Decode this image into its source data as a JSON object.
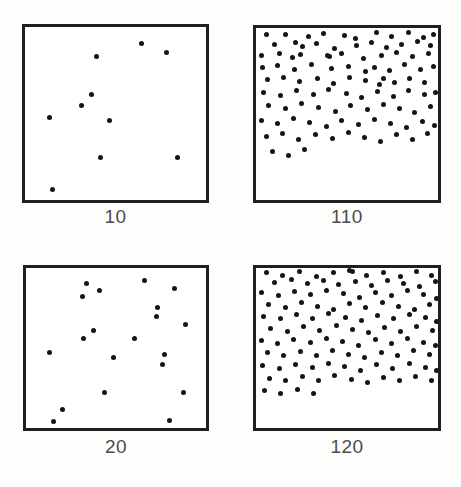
{
  "figure": {
    "width": 461,
    "height": 487,
    "background_color": "#fdfdfc",
    "frame_color": "#1f1f1f",
    "frame_width_px": 3,
    "dot_color": "#151515",
    "dot_diameter_px": 5,
    "label_color": "#4c4c4c",
    "label_font_size_px": 19
  },
  "chart_data": {
    "type": "scatter",
    "title": "",
    "subtitle": "",
    "xlabel": "",
    "ylabel": "",
    "grid": false,
    "legend": null,
    "axis_ticks": false,
    "xlim": [
      0,
      1
    ],
    "ylim": [
      0,
      1
    ],
    "panels": [
      {
        "id": "panel-10",
        "label": "10",
        "count": 10,
        "row": 0,
        "col": 0,
        "frame": {
          "x": 22,
          "y": 24,
          "width": 187,
          "height": 179
        },
        "label_y": 206,
        "points": [
          [
            0.395,
            0.168
          ],
          [
            0.642,
            0.095
          ],
          [
            0.781,
            0.145
          ],
          [
            0.369,
            0.391
          ],
          [
            0.31,
            0.452
          ],
          [
            0.134,
            0.525
          ],
          [
            0.465,
            0.542
          ],
          [
            0.417,
            0.754
          ],
          [
            0.845,
            0.754
          ],
          [
            0.15,
            0.939
          ]
        ]
      },
      {
        "id": "panel-110",
        "label": "110",
        "count": 110,
        "row": 0,
        "col": 1,
        "frame": {
          "x": 253,
          "y": 25,
          "width": 188,
          "height": 178
        },
        "label_y": 206,
        "points": [
          [
            0.055,
            0.04
          ],
          [
            0.163,
            0.036
          ],
          [
            0.286,
            0.052
          ],
          [
            0.373,
            0.03
          ],
          [
            0.487,
            0.044
          ],
          [
            0.546,
            0.062
          ],
          [
            0.661,
            0.028
          ],
          [
            0.742,
            0.05
          ],
          [
            0.838,
            0.024
          ],
          [
            0.921,
            0.056
          ],
          [
            0.978,
            0.038
          ],
          [
            0.1,
            0.095
          ],
          [
            0.215,
            0.082
          ],
          [
            0.258,
            0.108
          ],
          [
            0.33,
            0.09
          ],
          [
            0.43,
            0.118
          ],
          [
            0.552,
            0.1
          ],
          [
            0.632,
            0.082
          ],
          [
            0.716,
            0.112
          ],
          [
            0.802,
            0.094
          ],
          [
            0.885,
            0.076
          ],
          [
            0.958,
            0.104
          ],
          [
            0.028,
            0.16
          ],
          [
            0.128,
            0.148
          ],
          [
            0.198,
            0.172
          ],
          [
            0.243,
            0.152
          ],
          [
            0.392,
            0.162
          ],
          [
            0.403,
            0.168
          ],
          [
            0.47,
            0.146
          ],
          [
            0.588,
            0.176
          ],
          [
            0.688,
            0.158
          ],
          [
            0.77,
            0.14
          ],
          [
            0.861,
            0.168
          ],
          [
            0.946,
            0.15
          ],
          [
            0.038,
            0.232
          ],
          [
            0.12,
            0.218
          ],
          [
            0.211,
            0.244
          ],
          [
            0.307,
            0.21
          ],
          [
            0.414,
            0.238
          ],
          [
            0.508,
            0.222
          ],
          [
            0.6,
            0.252
          ],
          [
            0.652,
            0.228
          ],
          [
            0.732,
            0.246
          ],
          [
            0.818,
            0.214
          ],
          [
            0.902,
            0.24
          ],
          [
            0.974,
            0.224
          ],
          [
            0.065,
            0.3
          ],
          [
            0.152,
            0.288
          ],
          [
            0.24,
            0.312
          ],
          [
            0.336,
            0.294
          ],
          [
            0.428,
            0.32
          ],
          [
            0.512,
            0.286
          ],
          [
            0.6,
            0.306
          ],
          [
            0.678,
            0.33
          ],
          [
            0.7,
            0.296
          ],
          [
            0.76,
            0.318
          ],
          [
            0.846,
            0.292
          ],
          [
            0.928,
            0.314
          ],
          [
            0.042,
            0.376
          ],
          [
            0.136,
            0.392
          ],
          [
            0.224,
            0.364
          ],
          [
            0.318,
            0.388
          ],
          [
            0.4,
            0.358
          ],
          [
            0.496,
            0.382
          ],
          [
            0.582,
            0.404
          ],
          [
            0.668,
            0.37
          ],
          [
            0.755,
            0.396
          ],
          [
            0.84,
            0.362
          ],
          [
            0.926,
            0.388
          ],
          [
            0.985,
            0.374
          ],
          [
            0.07,
            0.452
          ],
          [
            0.16,
            0.47
          ],
          [
            0.252,
            0.44
          ],
          [
            0.344,
            0.464
          ],
          [
            0.435,
            0.486
          ],
          [
            0.52,
            0.448
          ],
          [
            0.612,
            0.472
          ],
          [
            0.7,
            0.442
          ],
          [
            0.788,
            0.466
          ],
          [
            0.872,
            0.492
          ],
          [
            0.958,
            0.456
          ],
          [
            0.03,
            0.54
          ],
          [
            0.118,
            0.556
          ],
          [
            0.205,
            0.528
          ],
          [
            0.296,
            0.552
          ],
          [
            0.388,
            0.574
          ],
          [
            0.472,
            0.536
          ],
          [
            0.564,
            0.56
          ],
          [
            0.652,
            0.53
          ],
          [
            0.74,
            0.554
          ],
          [
            0.828,
            0.578
          ],
          [
            0.914,
            0.544
          ],
          [
            0.98,
            0.566
          ],
          [
            0.058,
            0.63
          ],
          [
            0.148,
            0.612
          ],
          [
            0.236,
            0.648
          ],
          [
            0.328,
            0.62
          ],
          [
            0.42,
            0.644
          ],
          [
            0.508,
            0.608
          ],
          [
            0.596,
            0.636
          ],
          [
            0.684,
            0.66
          ],
          [
            0.772,
            0.622
          ],
          [
            0.86,
            0.646
          ],
          [
            0.944,
            0.616
          ],
          [
            0.09,
            0.72
          ],
          [
            0.178,
            0.742
          ],
          [
            0.268,
            0.706
          ]
        ]
      },
      {
        "id": "panel-20",
        "label": "20",
        "count": 20,
        "row": 1,
        "col": 0,
        "frame": {
          "x": 23,
          "y": 265,
          "width": 186,
          "height": 166
        },
        "label_y": 436,
        "points": [
          [
            0.338,
            0.095
          ],
          [
            0.66,
            0.075
          ],
          [
            0.408,
            0.14
          ],
          [
            0.823,
            0.128
          ],
          [
            0.314,
            0.178
          ],
          [
            0.729,
            0.245
          ],
          [
            0.726,
            0.3
          ],
          [
            0.886,
            0.356
          ],
          [
            0.376,
            0.392
          ],
          [
            0.318,
            0.44
          ],
          [
            0.6,
            0.438
          ],
          [
            0.133,
            0.525
          ],
          [
            0.485,
            0.562
          ],
          [
            0.768,
            0.538
          ],
          [
            0.757,
            0.6
          ],
          [
            0.434,
            0.778
          ],
          [
            0.876,
            0.776
          ],
          [
            0.205,
            0.885
          ],
          [
            0.153,
            0.962
          ],
          [
            0.795,
            0.955
          ]
        ]
      },
      {
        "id": "panel-120",
        "label": "120",
        "count": 120,
        "row": 1,
        "col": 1,
        "frame": {
          "x": 253,
          "y": 265,
          "width": 188,
          "height": 166
        },
        "label_y": 436,
        "points": [
          [
            0.06,
            0.028
          ],
          [
            0.148,
            0.046
          ],
          [
            0.24,
            0.022
          ],
          [
            0.332,
            0.052
          ],
          [
            0.425,
            0.03
          ],
          [
            0.512,
            0.018
          ],
          [
            0.53,
            0.022
          ],
          [
            0.608,
            0.048
          ],
          [
            0.7,
            0.026
          ],
          [
            0.792,
            0.05
          ],
          [
            0.88,
            0.024
          ],
          [
            0.962,
            0.044
          ],
          [
            0.104,
            0.09
          ],
          [
            0.196,
            0.072
          ],
          [
            0.285,
            0.098
          ],
          [
            0.37,
            0.08
          ],
          [
            0.455,
            0.104
          ],
          [
            0.545,
            0.086
          ],
          [
            0.636,
            0.11
          ],
          [
            0.724,
            0.078
          ],
          [
            0.812,
            0.096
          ],
          [
            0.9,
            0.118
          ],
          [
            0.984,
            0.086
          ],
          [
            0.032,
            0.152
          ],
          [
            0.125,
            0.17
          ],
          [
            0.214,
            0.144
          ],
          [
            0.302,
            0.166
          ],
          [
            0.39,
            0.138
          ],
          [
            0.48,
            0.162
          ],
          [
            0.566,
            0.184
          ],
          [
            0.655,
            0.15
          ],
          [
            0.745,
            0.172
          ],
          [
            0.834,
            0.142
          ],
          [
            0.92,
            0.166
          ],
          [
            0.992,
            0.188
          ],
          [
            0.07,
            0.226
          ],
          [
            0.16,
            0.248
          ],
          [
            0.248,
            0.218
          ],
          [
            0.338,
            0.24
          ],
          [
            0.428,
            0.262
          ],
          [
            0.516,
            0.224
          ],
          [
            0.604,
            0.246
          ],
          [
            0.694,
            0.216
          ],
          [
            0.782,
            0.238
          ],
          [
            0.87,
            0.26
          ],
          [
            0.956,
            0.228
          ],
          [
            0.042,
            0.3
          ],
          [
            0.132,
            0.318
          ],
          [
            0.222,
            0.292
          ],
          [
            0.312,
            0.314
          ],
          [
            0.4,
            0.286
          ],
          [
            0.49,
            0.308
          ],
          [
            0.578,
            0.33
          ],
          [
            0.668,
            0.296
          ],
          [
            0.758,
            0.318
          ],
          [
            0.846,
            0.288
          ],
          [
            0.934,
            0.312
          ],
          [
            0.99,
            0.334
          ],
          [
            0.082,
            0.376
          ],
          [
            0.172,
            0.394
          ],
          [
            0.262,
            0.368
          ],
          [
            0.35,
            0.39
          ],
          [
            0.44,
            0.362
          ],
          [
            0.528,
            0.384
          ],
          [
            0.618,
            0.406
          ],
          [
            0.706,
            0.372
          ],
          [
            0.796,
            0.394
          ],
          [
            0.884,
            0.364
          ],
          [
            0.97,
            0.388
          ],
          [
            0.028,
            0.452
          ],
          [
            0.118,
            0.47
          ],
          [
            0.208,
            0.444
          ],
          [
            0.298,
            0.466
          ],
          [
            0.386,
            0.438
          ],
          [
            0.476,
            0.46
          ],
          [
            0.564,
            0.482
          ],
          [
            0.654,
            0.448
          ],
          [
            0.742,
            0.47
          ],
          [
            0.832,
            0.44
          ],
          [
            0.92,
            0.464
          ],
          [
            0.986,
            0.486
          ],
          [
            0.062,
            0.53
          ],
          [
            0.152,
            0.548
          ],
          [
            0.242,
            0.522
          ],
          [
            0.33,
            0.544
          ],
          [
            0.42,
            0.516
          ],
          [
            0.508,
            0.538
          ],
          [
            0.598,
            0.56
          ],
          [
            0.688,
            0.526
          ],
          [
            0.776,
            0.548
          ],
          [
            0.864,
            0.518
          ],
          [
            0.952,
            0.542
          ],
          [
            0.038,
            0.608
          ],
          [
            0.128,
            0.626
          ],
          [
            0.218,
            0.6
          ],
          [
            0.308,
            0.622
          ],
          [
            0.396,
            0.594
          ],
          [
            0.486,
            0.616
          ],
          [
            0.574,
            0.638
          ],
          [
            0.664,
            0.604
          ],
          [
            0.752,
            0.626
          ],
          [
            0.842,
            0.596
          ],
          [
            0.93,
            0.62
          ],
          [
            0.994,
            0.642
          ],
          [
            0.074,
            0.688
          ],
          [
            0.164,
            0.706
          ],
          [
            0.254,
            0.68
          ],
          [
            0.344,
            0.702
          ],
          [
            0.432,
            0.674
          ],
          [
            0.522,
            0.696
          ],
          [
            0.61,
            0.718
          ],
          [
            0.7,
            0.684
          ],
          [
            0.788,
            0.706
          ],
          [
            0.876,
            0.676
          ],
          [
            0.964,
            0.7
          ],
          [
            0.046,
            0.768
          ],
          [
            0.136,
            0.786
          ],
          [
            0.226,
            0.76
          ],
          [
            0.316,
            0.782
          ]
        ]
      }
    ]
  }
}
